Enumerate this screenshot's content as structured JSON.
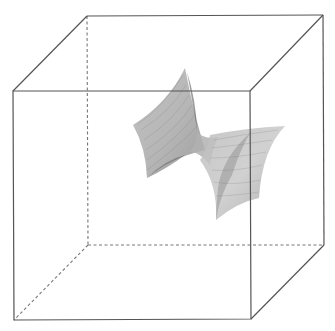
{
  "figure": {
    "colors": {
      "background": "#ffffff",
      "edge": "#555555",
      "hidden_edge": "#777777",
      "surface_light": "#c8c8c8",
      "surface_dark": "#6e6e6e"
    },
    "cube": {
      "front_face": {
        "top_left": [
          13,
          91
        ],
        "top_right": [
          250,
          91
        ],
        "bottom_right": [
          251,
          319
        ],
        "bottom_left": [
          14,
          320
        ]
      },
      "back_face": {
        "top_left": [
          87,
          16
        ],
        "top_right": [
          323,
          15
        ],
        "bottom_right": [
          324,
          245
        ],
        "bottom_left": [
          88,
          245
        ]
      },
      "hidden_edges": [
        "back_top_left-back_bottom_left",
        "back_bottom_left-back_bottom_right",
        "back_bottom_left-front_bottom_left"
      ]
    },
    "surface": {
      "left_wing": {
        "top_tip": [
          185,
          68
        ],
        "left_tip": [
          133,
          125
        ],
        "bottom_tip": [
          147,
          178
        ],
        "waist": [
          205,
          140
        ]
      },
      "right_wing": {
        "right_tip": [
          285,
          126
        ],
        "bottom_tip": [
          216,
          220
        ],
        "lower_right": [
          259,
          198
        ],
        "waist": [
          205,
          140
        ]
      }
    }
  }
}
